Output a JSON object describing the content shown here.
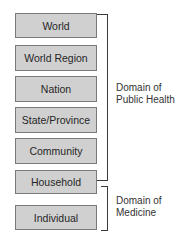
{
  "levels": [
    {
      "label": "World"
    },
    {
      "label": "World Region"
    },
    {
      "label": "Nation"
    },
    {
      "label": "State/Province"
    },
    {
      "label": "Community"
    },
    {
      "label": "Household"
    },
    {
      "label": "Individual"
    }
  ],
  "domains": {
    "public_health": {
      "line1": "Domain of",
      "line2": "Public Health",
      "spans": [
        "World",
        "Household"
      ]
    },
    "medicine": {
      "line1": "Domain of",
      "line2": "Medicine",
      "spans": [
        "Household",
        "Individual"
      ]
    }
  },
  "colors": {
    "box_fill": "#d0d0d0",
    "box_border": "#7a7a7a",
    "bracket": "#3a3a3a"
  }
}
